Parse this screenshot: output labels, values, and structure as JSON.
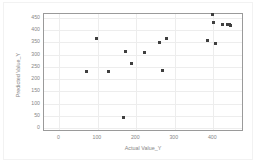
{
  "chart_data": {
    "type": "scatter",
    "title": "",
    "xlabel": "Actual Value_Y",
    "ylabel": "Predicted Value_Y",
    "xlim": [
      -40,
      480
    ],
    "ylim": [
      -15,
      465
    ],
    "xticks": [
      0,
      100,
      200,
      300,
      400
    ],
    "yticks": [
      0,
      50,
      100,
      150,
      200,
      250,
      300,
      350,
      400,
      450
    ],
    "xtick_labels": [
      "0",
      "100",
      "200",
      "300",
      "400"
    ],
    "ytick_labels": [
      "0",
      "50",
      "100",
      "150",
      "200",
      "250",
      "300",
      "350",
      "400",
      "450"
    ],
    "grid": true,
    "legend": false,
    "marker_color": "#3f3f3f",
    "frame_color": "#9a9a9a",
    "gridline_color": "#ededed",
    "tick_text_color": "#868686",
    "points": [
      {
        "x": 70,
        "y": 230
      },
      {
        "x": 96,
        "y": 366
      },
      {
        "x": 127,
        "y": 230
      },
      {
        "x": 167,
        "y": 45
      },
      {
        "x": 172,
        "y": 312
      },
      {
        "x": 187,
        "y": 265
      },
      {
        "x": 221,
        "y": 307
      },
      {
        "x": 260,
        "y": 348
      },
      {
        "x": 268,
        "y": 236
      },
      {
        "x": 279,
        "y": 366
      },
      {
        "x": 385,
        "y": 358
      },
      {
        "x": 398,
        "y": 463
      },
      {
        "x": 400,
        "y": 430
      },
      {
        "x": 407,
        "y": 345
      },
      {
        "x": 424,
        "y": 422
      },
      {
        "x": 436,
        "y": 421
      },
      {
        "x": 441,
        "y": 421
      },
      {
        "x": 445,
        "y": 420
      }
    ]
  }
}
